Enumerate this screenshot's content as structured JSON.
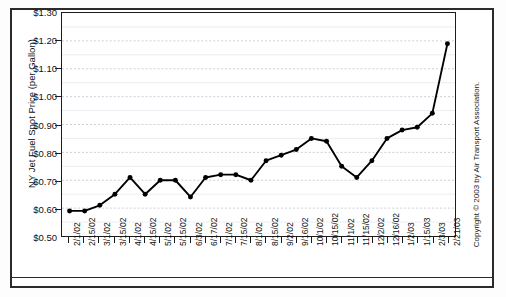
{
  "figure": {
    "y_axis_title": "NY Jet Fuel Spot Price (per Gallon)",
    "copyright": "Copyright © 2003 by Air Transport Association."
  },
  "chart_data": {
    "type": "line",
    "title": "",
    "xlabel": "",
    "ylabel": "NY Jet Fuel Spot Price (per Gallon)",
    "ylim": [
      0.5,
      1.3
    ],
    "ytick_labels": [
      "$1.30",
      "$1.20",
      "$1.10",
      "$1.00",
      "$0.90",
      "$0.80",
      "$0.70",
      "$0.60",
      "$0.50"
    ],
    "ytick_values": [
      1.3,
      1.2,
      1.1,
      1.0,
      0.9,
      0.8,
      0.7,
      0.6,
      0.5
    ],
    "grid": true,
    "grid_axis": "y",
    "legend": null,
    "marker": "filled-circle",
    "line_color": "#000000",
    "categories": [
      "2/1/02",
      "2/15/02",
      "3/1/02",
      "3/15/02",
      "4/1/02",
      "4/15/02",
      "5/1/02",
      "5/15/02",
      "6/3/02",
      "6/17/02",
      "7/1/02",
      "7/15/02",
      "8/1/02",
      "8/15/02",
      "9/2/02",
      "9/16/02",
      "10/1/02",
      "10/15/02",
      "11/1/02",
      "11/15/02",
      "12/2/02",
      "12/16/02",
      "1/2/03",
      "1/15/03",
      "2/3/03",
      "2/21/03"
    ],
    "values": [
      0.59,
      0.59,
      0.61,
      0.65,
      0.71,
      0.65,
      0.7,
      0.7,
      0.64,
      0.71,
      0.72,
      0.72,
      0.7,
      0.77,
      0.79,
      0.81,
      0.85,
      0.84,
      0.75,
      0.71,
      0.77,
      0.85,
      0.88,
      0.89,
      0.94,
      1.19
    ]
  }
}
